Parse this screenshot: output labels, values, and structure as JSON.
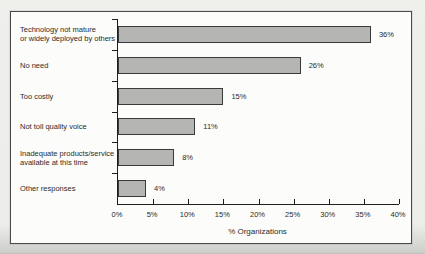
{
  "chart_data": {
    "type": "bar",
    "orientation": "horizontal",
    "categories": [
      "Technology not mature\nor widely deployed by others",
      "No need",
      "Too costly",
      "Not toll quality voice",
      "Inadequate products/service\navailable at this time",
      "Other responses"
    ],
    "values": [
      36,
      26,
      15,
      11,
      8,
      4
    ],
    "value_labels": [
      "36%",
      "26%",
      "15%",
      "11%",
      "8%",
      "4%"
    ],
    "title": "",
    "xlabel": "% Organizations",
    "ylabel": "",
    "xlim": [
      0,
      40
    ],
    "x_ticks": [
      "0%",
      "5%",
      "10%",
      "15%",
      "20%",
      "25%",
      "30%",
      "35%",
      "40%"
    ],
    "grid": false,
    "legend": false,
    "bar_color": "#b5b5b3",
    "bar_border_color": "#3a3a3a",
    "axis_color": "#1e1e1e"
  }
}
